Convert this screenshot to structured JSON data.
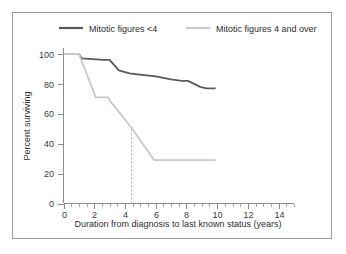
{
  "figure": {
    "background": "#ffffff",
    "border_color": "#9a9a9a"
  },
  "legend": {
    "position": "top",
    "entries": [
      {
        "label": "Mitotic figures <4",
        "color": "#5a5a5a"
      },
      {
        "label": "Mitotic figures 4 and over",
        "color": "#c9c9c9"
      }
    ]
  },
  "axes": {
    "x_title": "Duration from diagnosis to last known status (years)",
    "y_title": "Percent surviving",
    "x_ticks": [
      "0",
      "2",
      "4",
      "6",
      "8",
      "10",
      "12",
      "14"
    ],
    "y_ticks": [
      "0",
      "20",
      "40",
      "60",
      "80",
      "100"
    ]
  },
  "annotation": {
    "marker_label": "",
    "marker_x": 4.4,
    "marker_y_top": 51,
    "marker_color": "#b4b4b4"
  },
  "chart_data": {
    "type": "line",
    "title": "",
    "subtitle": "",
    "xlabel": "Duration from diagnosis to last known status (years)",
    "ylabel": "Percent surviving",
    "xlim": [
      0,
      15
    ],
    "ylim": [
      0,
      104
    ],
    "xticks": [
      0,
      2,
      4,
      6,
      8,
      10,
      12,
      14
    ],
    "yticks": [
      0,
      20,
      40,
      60,
      80,
      100
    ],
    "x_minor_tick_step": 0.5,
    "grid": false,
    "legend_position": "top",
    "annotations": [
      {
        "type": "vertical-dashed-line",
        "x": 4.4,
        "y_from": 0,
        "y_to": 51,
        "color": "#b4b4b4",
        "note": "median survival marker for Mitotic figures 4 and over"
      }
    ],
    "series": [
      {
        "name": "Mitotic figures <4",
        "color": "#5a5a5a",
        "line_width": 1.8,
        "x": [
          0,
          1.0,
          1.2,
          2.6,
          3.0,
          3.6,
          4.3,
          5.1,
          6.0,
          7.0,
          7.7,
          8.1,
          8.9,
          9.3,
          9.9
        ],
        "y": [
          100,
          100,
          97,
          96,
          96,
          89,
          87,
          86,
          85,
          83,
          82,
          82,
          78,
          77,
          77
        ]
      },
      {
        "name": "Mitotic figures 4 and over",
        "color": "#c9c9c9",
        "line_width": 1.8,
        "x": [
          0,
          1.0,
          1.05,
          2.1,
          2.9,
          3.0,
          4.4,
          5.9,
          6.0,
          9.9
        ],
        "y": [
          100,
          100,
          99,
          71,
          71,
          69,
          51,
          29,
          29,
          29
        ]
      }
    ]
  }
}
